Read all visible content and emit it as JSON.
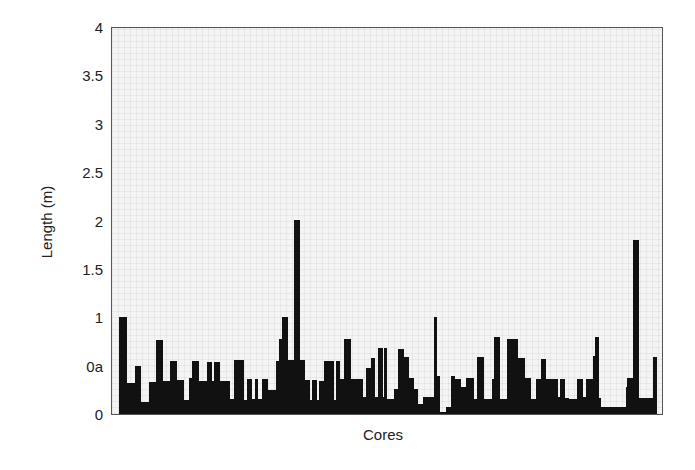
{
  "chart_data": {
    "type": "bar",
    "title": "",
    "xlabel": "Cores",
    "ylabel": "Length (m)",
    "ylim": [
      0,
      4
    ],
    "grid": true,
    "legend": null,
    "y_ticks": [
      "0",
      "0a",
      "1",
      "1.5",
      "2",
      "2.5",
      "3",
      "3.5",
      "4"
    ],
    "y_tick_values": [
      0,
      0.5,
      1,
      1.5,
      2,
      2.5,
      3,
      3.5,
      4
    ],
    "note": "Bars are variable-width segments along the x-axis; x0/x1 given in pixels relative to plot left edge, values in meters.",
    "bars": [
      {
        "x0": 7,
        "x1": 15,
        "value": 1.0
      },
      {
        "x0": 15,
        "x1": 23,
        "value": 0.32
      },
      {
        "x0": 23,
        "x1": 29,
        "value": 0.5
      },
      {
        "x0": 29,
        "x1": 37,
        "value": 0.12
      },
      {
        "x0": 37,
        "x1": 44,
        "value": 0.33
      },
      {
        "x0": 44,
        "x1": 51,
        "value": 0.76
      },
      {
        "x0": 51,
        "x1": 58,
        "value": 0.34
      },
      {
        "x0": 58,
        "x1": 65,
        "value": 0.55
      },
      {
        "x0": 65,
        "x1": 72,
        "value": 0.35
      },
      {
        "x0": 72,
        "x1": 77,
        "value": 0.14
      },
      {
        "x0": 77,
        "x1": 80,
        "value": 0.37
      },
      {
        "x0": 80,
        "x1": 87,
        "value": 0.55
      },
      {
        "x0": 87,
        "x1": 95,
        "value": 0.34
      },
      {
        "x0": 95,
        "x1": 100,
        "value": 0.54
      },
      {
        "x0": 100,
        "x1": 102,
        "value": 0.34
      },
      {
        "x0": 102,
        "x1": 108,
        "value": 0.54
      },
      {
        "x0": 108,
        "x1": 118,
        "value": 0.34
      },
      {
        "x0": 118,
        "x1": 122,
        "value": 0.15
      },
      {
        "x0": 122,
        "x1": 132,
        "value": 0.56
      },
      {
        "x0": 132,
        "x1": 135,
        "value": 0.14
      },
      {
        "x0": 135,
        "x1": 140,
        "value": 0.36
      },
      {
        "x0": 140,
        "x1": 143,
        "value": 0.15
      },
      {
        "x0": 143,
        "x1": 146,
        "value": 0.36
      },
      {
        "x0": 146,
        "x1": 150,
        "value": 0.15
      },
      {
        "x0": 150,
        "x1": 156,
        "value": 0.36
      },
      {
        "x0": 156,
        "x1": 164,
        "value": 0.25
      },
      {
        "x0": 164,
        "x1": 167,
        "value": 0.55
      },
      {
        "x0": 167,
        "x1": 170,
        "value": 0.78
      },
      {
        "x0": 170,
        "x1": 176,
        "value": 1.0
      },
      {
        "x0": 176,
        "x1": 182,
        "value": 0.56
      },
      {
        "x0": 182,
        "x1": 188,
        "value": 2.0
      },
      {
        "x0": 188,
        "x1": 193,
        "value": 0.56
      },
      {
        "x0": 193,
        "x1": 198,
        "value": 0.35
      },
      {
        "x0": 198,
        "x1": 200,
        "value": 0.14
      },
      {
        "x0": 200,
        "x1": 205,
        "value": 0.35
      },
      {
        "x0": 205,
        "x1": 207,
        "value": 0.14
      },
      {
        "x0": 207,
        "x1": 212,
        "value": 0.34
      },
      {
        "x0": 212,
        "x1": 222,
        "value": 0.55
      },
      {
        "x0": 222,
        "x1": 224,
        "value": 0.14
      },
      {
        "x0": 224,
        "x1": 228,
        "value": 0.55
      },
      {
        "x0": 228,
        "x1": 232,
        "value": 0.36
      },
      {
        "x0": 232,
        "x1": 239,
        "value": 0.78
      },
      {
        "x0": 239,
        "x1": 251,
        "value": 0.36
      },
      {
        "x0": 251,
        "x1": 254,
        "value": 0.18
      },
      {
        "x0": 254,
        "x1": 259,
        "value": 0.48
      },
      {
        "x0": 259,
        "x1": 263,
        "value": 0.58
      },
      {
        "x0": 263,
        "x1": 266,
        "value": 0.18
      },
      {
        "x0": 266,
        "x1": 271,
        "value": 0.68
      },
      {
        "x0": 271,
        "x1": 272,
        "value": 0.18
      },
      {
        "x0": 272,
        "x1": 275,
        "value": 0.68
      },
      {
        "x0": 275,
        "x1": 282,
        "value": 0.16
      },
      {
        "x0": 282,
        "x1": 286,
        "value": 0.26
      },
      {
        "x0": 286,
        "x1": 292,
        "value": 0.67
      },
      {
        "x0": 292,
        "x1": 297,
        "value": 0.59
      },
      {
        "x0": 297,
        "x1": 302,
        "value": 0.37
      },
      {
        "x0": 302,
        "x1": 306,
        "value": 0.26
      },
      {
        "x0": 306,
        "x1": 311,
        "value": 0.1
      },
      {
        "x0": 311,
        "x1": 322,
        "value": 0.18
      },
      {
        "x0": 322,
        "x1": 325,
        "value": 1.0
      },
      {
        "x0": 325,
        "x1": 328,
        "value": 0.39
      },
      {
        "x0": 328,
        "x1": 334,
        "value": 0.02
      },
      {
        "x0": 334,
        "x1": 339,
        "value": 0.07
      },
      {
        "x0": 339,
        "x1": 343,
        "value": 0.39
      },
      {
        "x0": 343,
        "x1": 349,
        "value": 0.36
      },
      {
        "x0": 349,
        "x1": 354,
        "value": 0.28
      },
      {
        "x0": 354,
        "x1": 362,
        "value": 0.37
      },
      {
        "x0": 362,
        "x1": 365,
        "value": 0.15
      },
      {
        "x0": 365,
        "x1": 372,
        "value": 0.59
      },
      {
        "x0": 372,
        "x1": 380,
        "value": 0.15
      },
      {
        "x0": 380,
        "x1": 382,
        "value": 0.36
      },
      {
        "x0": 382,
        "x1": 388,
        "value": 0.8
      },
      {
        "x0": 388,
        "x1": 395,
        "value": 0.15
      },
      {
        "x0": 395,
        "x1": 406,
        "value": 0.78
      },
      {
        "x0": 406,
        "x1": 413,
        "value": 0.58
      },
      {
        "x0": 413,
        "x1": 419,
        "value": 0.37
      },
      {
        "x0": 419,
        "x1": 424,
        "value": 0.16
      },
      {
        "x0": 424,
        "x1": 429,
        "value": 0.36
      },
      {
        "x0": 429,
        "x1": 434,
        "value": 0.57
      },
      {
        "x0": 434,
        "x1": 446,
        "value": 0.36
      },
      {
        "x0": 446,
        "x1": 448,
        "value": 0.18
      },
      {
        "x0": 448,
        "x1": 453,
        "value": 0.36
      },
      {
        "x0": 453,
        "x1": 457,
        "value": 0.17
      },
      {
        "x0": 457,
        "x1": 465,
        "value": 0.15
      },
      {
        "x0": 465,
        "x1": 471,
        "value": 0.36
      },
      {
        "x0": 471,
        "x1": 474,
        "value": 0.18
      },
      {
        "x0": 474,
        "x1": 479,
        "value": 0.36
      },
      {
        "x0": 479,
        "x1": 481,
        "value": 0.36
      },
      {
        "x0": 481,
        "x1": 483,
        "value": 0.6
      },
      {
        "x0": 483,
        "x1": 487,
        "value": 0.8
      },
      {
        "x0": 487,
        "x1": 489,
        "value": 0.17
      },
      {
        "x0": 489,
        "x1": 514,
        "value": 0.07
      },
      {
        "x0": 514,
        "x1": 515,
        "value": 0.28
      },
      {
        "x0": 515,
        "x1": 521,
        "value": 0.37
      },
      {
        "x0": 521,
        "x1": 527,
        "value": 1.8
      },
      {
        "x0": 527,
        "x1": 541,
        "value": 0.17
      },
      {
        "x0": 541,
        "x1": 545,
        "value": 0.59
      }
    ]
  }
}
